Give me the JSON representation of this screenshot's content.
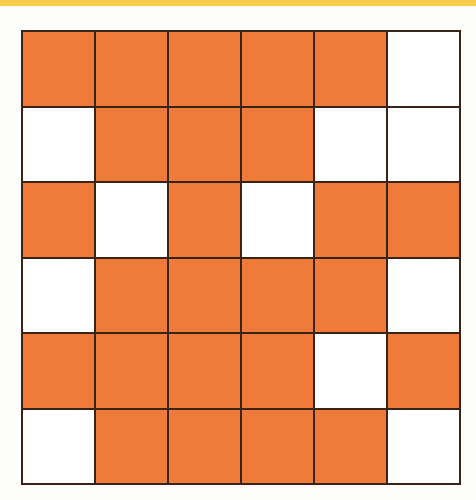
{
  "diagram": {
    "type": "grid",
    "rows": 6,
    "cols": 6,
    "colors": {
      "filled": "#f07a3a",
      "empty": "#ffffff",
      "lines": "#3a2418",
      "top_strip": "#f6cc4a"
    },
    "cells": [
      [
        1,
        1,
        1,
        1,
        1,
        0
      ],
      [
        0,
        1,
        1,
        1,
        0,
        0
      ],
      [
        1,
        0,
        1,
        0,
        1,
        1
      ],
      [
        0,
        1,
        1,
        1,
        1,
        0
      ],
      [
        1,
        1,
        1,
        1,
        0,
        1
      ],
      [
        0,
        1,
        1,
        1,
        1,
        0
      ]
    ],
    "filled_count": 24,
    "empty_count": 12
  }
}
